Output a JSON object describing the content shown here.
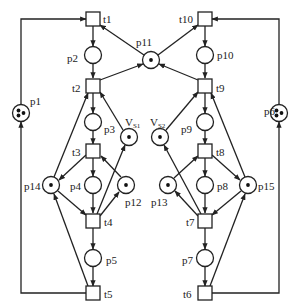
{
  "diagram": {
    "type": "petri-net",
    "places": [
      {
        "id": "p1",
        "label": "p1",
        "tokens": 3
      },
      {
        "id": "p2",
        "label": "p2",
        "tokens": 0
      },
      {
        "id": "p3",
        "label": "p3",
        "tokens": 0
      },
      {
        "id": "p4",
        "label": "p4",
        "tokens": 0
      },
      {
        "id": "p5",
        "label": "p5",
        "tokens": 0
      },
      {
        "id": "p6",
        "label": "p6",
        "tokens": 3
      },
      {
        "id": "p7",
        "label": "p7",
        "tokens": 0
      },
      {
        "id": "p8",
        "label": "p8",
        "tokens": 0
      },
      {
        "id": "p9",
        "label": "p9",
        "tokens": 0
      },
      {
        "id": "p10",
        "label": "p10",
        "tokens": 0
      },
      {
        "id": "p11",
        "label": "p11",
        "tokens": 1
      },
      {
        "id": "p12",
        "label": "p12",
        "tokens": 1
      },
      {
        "id": "p13",
        "label": "p13",
        "tokens": 1
      },
      {
        "id": "p14",
        "label": "p14",
        "tokens": 1
      },
      {
        "id": "p15",
        "label": "p15",
        "tokens": 1
      },
      {
        "id": "vs1",
        "label": "V",
        "sub": "S1",
        "tokens": 1
      },
      {
        "id": "vs2",
        "label": "V",
        "sub": "S2",
        "tokens": 1
      }
    ],
    "transitions": [
      {
        "id": "t1",
        "label": "t1"
      },
      {
        "id": "t2",
        "label": "t2"
      },
      {
        "id": "t3",
        "label": "t3"
      },
      {
        "id": "t4",
        "label": "t4"
      },
      {
        "id": "t5",
        "label": "t5"
      },
      {
        "id": "t6",
        "label": "t6"
      },
      {
        "id": "t7",
        "label": "t7"
      },
      {
        "id": "t8",
        "label": "t8"
      },
      {
        "id": "t9",
        "label": "t9"
      },
      {
        "id": "t10",
        "label": "t10"
      }
    ],
    "arcs": [
      [
        "p1",
        "t1"
      ],
      [
        "t1",
        "p2"
      ],
      [
        "p2",
        "t2"
      ],
      [
        "t2",
        "p11"
      ],
      [
        "p11",
        "t1"
      ],
      [
        "t2",
        "p3"
      ],
      [
        "p3",
        "t3"
      ],
      [
        "t3",
        "p4"
      ],
      [
        "t3",
        "p14"
      ],
      [
        "p12",
        "t3"
      ],
      [
        "p4",
        "t4"
      ],
      [
        "p14",
        "t4"
      ],
      [
        "t4",
        "p12"
      ],
      [
        "t4",
        "vs1"
      ],
      [
        "vs1",
        "t2"
      ],
      [
        "t4",
        "p5"
      ],
      [
        "p5",
        "t5"
      ],
      [
        "t5",
        "p14"
      ],
      [
        "t5",
        "p1"
      ],
      [
        "p14",
        "t2"
      ],
      [
        "p6",
        "t10"
      ],
      [
        "t10",
        "p10"
      ],
      [
        "p10",
        "t9"
      ],
      [
        "t9",
        "p11"
      ],
      [
        "p11",
        "t10"
      ],
      [
        "t9",
        "p9"
      ],
      [
        "p9",
        "t8"
      ],
      [
        "t8",
        "p8"
      ],
      [
        "t8",
        "p15"
      ],
      [
        "p13",
        "t8"
      ],
      [
        "p8",
        "t7"
      ],
      [
        "p15",
        "t7"
      ],
      [
        "t7",
        "p13"
      ],
      [
        "t7",
        "vs2"
      ],
      [
        "vs2",
        "t9"
      ],
      [
        "t7",
        "p7"
      ],
      [
        "p7",
        "t6"
      ],
      [
        "t6",
        "p15"
      ],
      [
        "t6",
        "p6"
      ],
      [
        "p15",
        "t9"
      ]
    ]
  }
}
